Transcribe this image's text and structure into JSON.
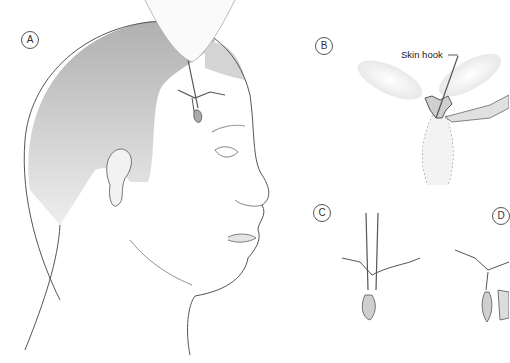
{
  "figure": {
    "panels": [
      {
        "id": "A",
        "label": "A",
        "description": "Profile of head with skin hook retracting forehead incision"
      },
      {
        "id": "B",
        "label": "B",
        "description": "Skin hook and scalpel excising tissue between elliptical flaps"
      },
      {
        "id": "C",
        "label": "C",
        "description": "Forceps inserted through incision"
      },
      {
        "id": "D",
        "label": "D",
        "description": "Resulting tissue after excision"
      }
    ],
    "annotations": {
      "skin_hook": "Skin hook"
    },
    "colors": {
      "line": "#555555",
      "shade": "#c8c8c8",
      "background": "#ffffff"
    }
  }
}
